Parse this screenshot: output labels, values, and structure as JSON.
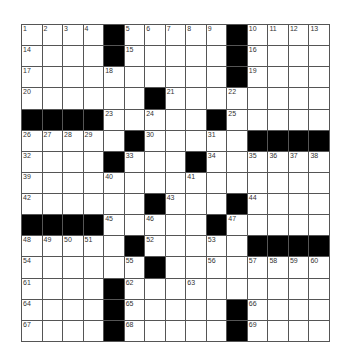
{
  "puzzle": {
    "size": {
      "rows": 15,
      "cols": 15
    },
    "colors": {
      "block": "#000000",
      "cell": "#ffffff",
      "line": "#555555"
    },
    "layout": [
      "....#.....#....",
      "....#.....#....",
      "..........#....",
      "......#........",
      "####.....#.....",
      ".....#.....####",
      "....#...#......",
      "...............",
      "......#...#....",
      "####.....#.....",
      ".....#.....####",
      "......#........",
      "....#..........",
      "....#.....#....",
      "....#.....#...."
    ],
    "numbers": [
      [
        1,
        2,
        3,
        4,
        0,
        5,
        6,
        7,
        8,
        9,
        0,
        10,
        11,
        12,
        13
      ],
      [
        14,
        0,
        0,
        0,
        0,
        15,
        0,
        0,
        0,
        0,
        0,
        16,
        0,
        0,
        0
      ],
      [
        17,
        0,
        0,
        0,
        18,
        0,
        0,
        0,
        0,
        0,
        0,
        19,
        0,
        0,
        0
      ],
      [
        20,
        0,
        0,
        0,
        0,
        0,
        0,
        21,
        0,
        0,
        22,
        0,
        0,
        0,
        0
      ],
      [
        0,
        0,
        0,
        0,
        23,
        0,
        24,
        0,
        0,
        0,
        25,
        0,
        0,
        0,
        0
      ],
      [
        26,
        27,
        28,
        29,
        0,
        0,
        30,
        0,
        0,
        31,
        0,
        0,
        0,
        0,
        0
      ],
      [
        32,
        0,
        0,
        0,
        0,
        33,
        0,
        0,
        0,
        34,
        0,
        35,
        36,
        37,
        38
      ],
      [
        39,
        0,
        0,
        0,
        40,
        0,
        0,
        0,
        41,
        0,
        0,
        0,
        0,
        0,
        0
      ],
      [
        42,
        0,
        0,
        0,
        0,
        0,
        0,
        43,
        0,
        0,
        0,
        44,
        0,
        0,
        0
      ],
      [
        0,
        0,
        0,
        0,
        45,
        0,
        46,
        0,
        0,
        0,
        47,
        0,
        0,
        0,
        0
      ],
      [
        48,
        49,
        50,
        51,
        0,
        0,
        52,
        0,
        0,
        53,
        0,
        0,
        0,
        0,
        0
      ],
      [
        54,
        0,
        0,
        0,
        0,
        55,
        0,
        0,
        0,
        56,
        0,
        57,
        58,
        59,
        60
      ],
      [
        61,
        0,
        0,
        0,
        0,
        62,
        0,
        0,
        63,
        0,
        0,
        0,
        0,
        0,
        0
      ],
      [
        64,
        0,
        0,
        0,
        0,
        65,
        0,
        0,
        0,
        0,
        0,
        66,
        0,
        0,
        0
      ],
      [
        67,
        0,
        0,
        0,
        0,
        68,
        0,
        0,
        0,
        0,
        0,
        69,
        0,
        0,
        0
      ]
    ]
  }
}
